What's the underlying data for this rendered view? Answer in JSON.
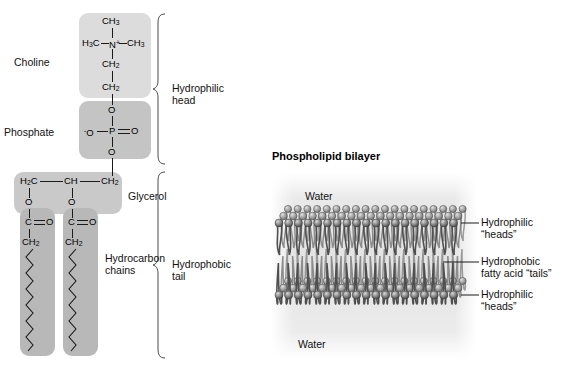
{
  "figure": {
    "left_panel": {
      "groups": [
        {
          "name": "Choline",
          "label": "Choline"
        },
        {
          "name": "Phosphate",
          "label": "Phosphate"
        },
        {
          "name": "Glycerol",
          "label": "Glycerol"
        },
        {
          "name": "Hydrocarbon chains",
          "label_line1": "Hydrocarbon",
          "label_line2": "chains"
        }
      ],
      "brackets": [
        {
          "label_line1": "Hydrophilic",
          "label_line2": "head"
        },
        {
          "label_line1": "Hydrophobic",
          "label_line2": "tail"
        }
      ],
      "atoms": {
        "choline_ch3_top": "CH3",
        "choline_h3c_left": "H3C",
        "choline_n": "N+",
        "choline_ch3_right": "CH3",
        "choline_ch2_a": "CH2",
        "choline_ch2_b": "CH2",
        "phosphate_o_top": "O",
        "phosphate_o_minus": "-O",
        "phosphate_p": "P",
        "phosphate_o_right": "O",
        "phosphate_o_bottom": "O",
        "glycerol_h2c": "H2C",
        "glycerol_ch": "CH",
        "glycerol_ch2": "CH2",
        "glycerol_o_left": "O",
        "glycerol_o_right": "O",
        "ester_c_left": "C",
        "ester_o_left": "O",
        "ester_c_right": "C",
        "ester_o_right": "O",
        "tail_ch2_left": "CH2",
        "tail_ch2_right": "CH2"
      }
    },
    "right_panel": {
      "title": "Phospholipid bilayer",
      "water_top": "Water",
      "water_bottom": "Water",
      "callouts": [
        {
          "line1": "Hydrophilic",
          "line2": "“heads”"
        },
        {
          "line1": "Hydrophobic",
          "line2": "fatty acid “tails”"
        },
        {
          "line1": "Hydrophilic",
          "line2": "“heads”"
        }
      ]
    }
  }
}
